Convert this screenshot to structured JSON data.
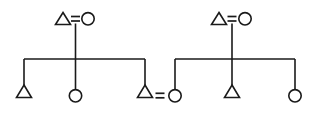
{
  "diagram": {
    "type": "genealogical-kinship-chart",
    "notation": "anthropological-kinship",
    "canvas": {
      "width": 315,
      "height": 114
    },
    "colors": {
      "background": "#ffffff",
      "stroke": "#1a1a1a",
      "fill": "#ffffff"
    },
    "legend": {
      "triangle_meaning": "male",
      "circle_meaning": "female",
      "equals_meaning": "marriage",
      "vertical_line_meaning": "descent",
      "horizontal_line_meaning": "sibling-set"
    },
    "symbols": {
      "male": "triangle",
      "female": "circle",
      "marriage": "="
    },
    "geometry": {
      "triangle_half_width": 7.5,
      "triangle_height": 11.5,
      "circle_radius": 6.2,
      "parent_row_y": 19,
      "sibling_bar_y": 59,
      "child_row_y": 96
    },
    "families": [
      {
        "id": "family-left",
        "name": "left-family",
        "parents": {
          "father": {
            "id": "f1-father",
            "sex": "male",
            "symbol": "triangle",
            "x": 63,
            "y": 19
          },
          "mother": {
            "id": "f1-mother",
            "sex": "female",
            "symbol": "circle",
            "x": 88,
            "y": 19
          },
          "marriage_mark": {
            "x": 75.5,
            "y": 19,
            "label": "="
          }
        },
        "descent_line": {
          "x": 75.5,
          "y_top": 25,
          "y_bottom": 59
        },
        "sibling_bar": {
          "y": 59,
          "x_left": 24,
          "x_right": 145
        },
        "children": [
          {
            "id": "f1-child-1",
            "sex": "male",
            "symbol": "triangle",
            "x": 24,
            "y": 96,
            "birth_order": 1
          },
          {
            "id": "f1-child-2",
            "sex": "female",
            "symbol": "circle",
            "x": 75.5,
            "y": 96,
            "birth_order": 2
          },
          {
            "id": "f1-child-3",
            "sex": "male",
            "symbol": "triangle",
            "x": 145,
            "y": 96,
            "birth_order": 3
          }
        ]
      },
      {
        "id": "family-right",
        "name": "right-family",
        "parents": {
          "father": {
            "id": "f2-father",
            "sex": "male",
            "symbol": "triangle",
            "x": 219,
            "y": 19
          },
          "mother": {
            "id": "f2-mother",
            "sex": "female",
            "symbol": "circle",
            "x": 245,
            "y": 19
          },
          "marriage_mark": {
            "x": 232,
            "y": 19,
            "label": "="
          }
        },
        "descent_line": {
          "x": 232,
          "y_top": 25,
          "y_bottom": 59
        },
        "sibling_bar": {
          "y": 59,
          "x_left": 175,
          "x_right": 295
        },
        "children": [
          {
            "id": "f2-child-1",
            "sex": "female",
            "symbol": "circle",
            "x": 175,
            "y": 96,
            "birth_order": 1
          },
          {
            "id": "f2-child-2",
            "sex": "male",
            "symbol": "triangle",
            "x": 232,
            "y": 96,
            "birth_order": 2
          },
          {
            "id": "f2-child-3",
            "sex": "female",
            "symbol": "circle",
            "x": 295,
            "y": 96,
            "birth_order": 3
          }
        ]
      }
    ],
    "marriages": [
      {
        "id": "marriage-top-left",
        "label": "=",
        "x": 75.5,
        "y": 19,
        "spouse_a": "f1-father",
        "spouse_b": "f1-mother",
        "generation": 1
      },
      {
        "id": "marriage-top-right",
        "label": "=",
        "x": 232,
        "y": 19,
        "spouse_a": "f2-father",
        "spouse_b": "f2-mother",
        "generation": 1
      },
      {
        "id": "marriage-cross-union",
        "label": "=",
        "x": 160,
        "y": 96,
        "spouse_a": "f1-child-3",
        "spouse_b": "f2-child-1",
        "generation": 2
      }
    ]
  }
}
